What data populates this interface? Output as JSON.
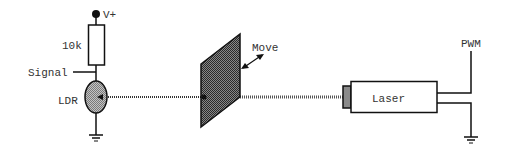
{
  "diagram": {
    "type": "circuit-schematic",
    "colors": {
      "line": "#111111",
      "text": "#333333",
      "ldr_fill": "#a8a8a8",
      "plate_fill": "#555555",
      "lens_fill": "#8a8a8a",
      "background": "#ffffff"
    },
    "labels": {
      "vplus": "V+",
      "resistor": "10k",
      "signal": "Signal",
      "ldr": "LDR",
      "move": "Move",
      "laser": "Laser",
      "pwm": "PWM"
    },
    "components": [
      {
        "id": "vplus-terminal",
        "label": "V+"
      },
      {
        "id": "resistor",
        "label": "10k"
      },
      {
        "id": "signal-output",
        "label": "Signal"
      },
      {
        "id": "ldr",
        "label": "LDR"
      },
      {
        "id": "ground-ldr"
      },
      {
        "id": "moving-plate",
        "label": "Move"
      },
      {
        "id": "light-beam"
      },
      {
        "id": "laser",
        "label": "Laser"
      },
      {
        "id": "pwm-input",
        "label": "PWM"
      },
      {
        "id": "ground-laser"
      }
    ]
  }
}
